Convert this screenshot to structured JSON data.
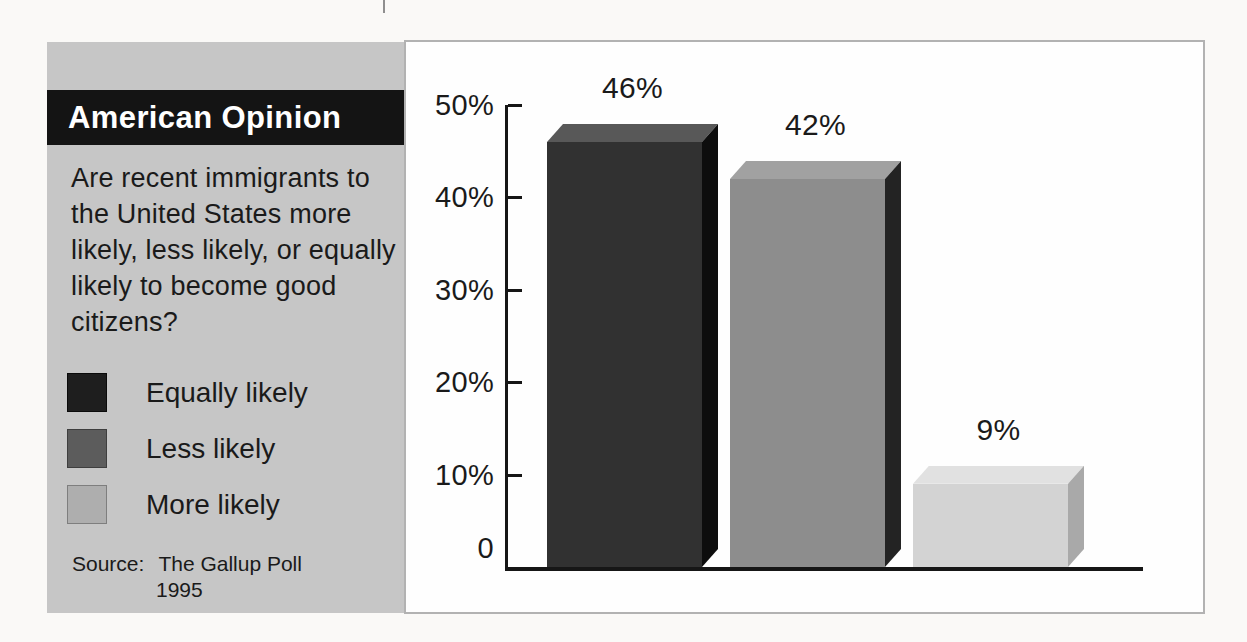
{
  "panel": {
    "title": "American Opinion",
    "question": "Are recent immigrants to the United States more likely, less likely, or equally likely to become good citizens?",
    "legend": [
      {
        "label": "Equally likely",
        "color": "#1e1e1e",
        "border": "#0a0a0a"
      },
      {
        "label": "Less likely",
        "color": "#5c5c5c",
        "border": "#3e3e3e"
      },
      {
        "label": "More likely",
        "color": "#aeaeae",
        "border": "#7e7e7e"
      }
    ],
    "source": {
      "prefix": "Source:",
      "text": "The Gallup Poll",
      "year": "1995"
    }
  },
  "chart_data": {
    "type": "bar",
    "title": "American Opinion",
    "categories": [
      "Equally likely",
      "Less likely",
      "More likely"
    ],
    "values": [
      46,
      42,
      9
    ],
    "bar_labels": [
      "46%",
      "42%",
      "9%"
    ],
    "xlabel": "",
    "ylabel": "",
    "ylim": [
      0,
      50
    ],
    "yticks": [
      {
        "value": 50,
        "label": "50%"
      },
      {
        "value": 40,
        "label": "40%"
      },
      {
        "value": 30,
        "label": "30%"
      },
      {
        "value": 20,
        "label": "20%"
      },
      {
        "value": 10,
        "label": "10%"
      },
      {
        "value": 0,
        "label": "0"
      }
    ],
    "grid": false,
    "legend_position": "left-panel",
    "source": "The Gallup Poll 1995",
    "bar_colors": [
      {
        "front": "#313131",
        "top": "#585858",
        "side": "#0d0d0d"
      },
      {
        "front": "#8d8d8d",
        "top": "#a1a1a1",
        "side": "#232323"
      },
      {
        "front": "#d3d3d3",
        "top": "#e1e1e1",
        "side": "#a9a9a9"
      }
    ]
  },
  "colors": {
    "page_bg": "#faf9f7",
    "panel_bg": "#c6c6c6",
    "titlebar_bg": "#141414",
    "title_text": "#ffffff",
    "text": "#1a1a1a",
    "box_bg": "#fefefe",
    "box_border": "#b2b2b2",
    "axis": "#161616"
  }
}
